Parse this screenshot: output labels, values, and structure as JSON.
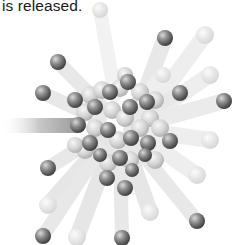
{
  "caption": {
    "text": "is released."
  },
  "illustration": {
    "subject": "nucleus-splitting",
    "palette": {
      "background": "#ffffff",
      "dark_ball": "#6f6f6f",
      "light_ball": "#cfcfcf",
      "trail": "#e6e6e6",
      "text": "#1a1a1a"
    }
  }
}
